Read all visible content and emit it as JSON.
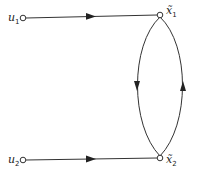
{
  "diagram": {
    "type": "signal-flow-graph",
    "nodes": [
      {
        "id": "u1",
        "symbol": "u",
        "subscript": "1"
      },
      {
        "id": "u2",
        "symbol": "u",
        "subscript": "2"
      },
      {
        "id": "x1",
        "symbol": "x̃",
        "subscript": "1"
      },
      {
        "id": "x2",
        "symbol": "x̃",
        "subscript": "2"
      }
    ],
    "edges": [
      {
        "from": "u1",
        "to": "x1",
        "shape": "straight"
      },
      {
        "from": "u2",
        "to": "x2",
        "shape": "straight"
      },
      {
        "from": "x1",
        "to": "x2",
        "shape": "left-arc"
      },
      {
        "from": "x2",
        "to": "x1",
        "shape": "right-arc"
      }
    ]
  }
}
